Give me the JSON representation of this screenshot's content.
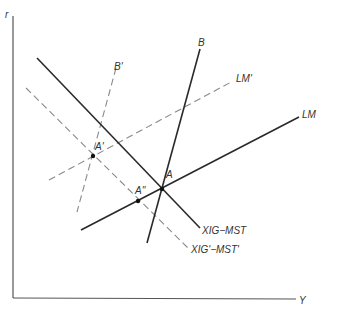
{
  "diagram": {
    "axes": {
      "y_label": "r",
      "x_label": "Y"
    },
    "curves": {
      "xig_mst": "XIG−MST",
      "xig_mst_prime": "XIG'−MST'",
      "lm": "LM",
      "lm_prime": "LM'",
      "b": "B",
      "b_prime": "B'"
    },
    "points": {
      "a": "A",
      "a_prime": "A'",
      "a_double_prime": "A''"
    }
  }
}
